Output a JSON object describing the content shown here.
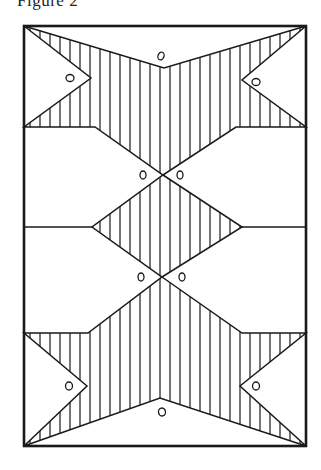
{
  "figure": {
    "title": "Figure 2",
    "colors": {
      "ink": "#1a1a1a",
      "paper": "#ffffff"
    },
    "frame": {
      "x1": 24,
      "y1": 26,
      "x2": 306,
      "y2": 446
    },
    "hatch_spacing": 10,
    "regions": [
      {
        "name": "top-hatched-band",
        "hatched": true,
        "points": [
          [
            24,
            26
          ],
          [
            164,
            68
          ],
          [
            306,
            26
          ],
          [
            242,
            80
          ],
          [
            306,
            127
          ],
          [
            236,
            127
          ],
          [
            163,
            175
          ],
          [
            95,
            127
          ],
          [
            24,
            127
          ],
          [
            91,
            78
          ]
        ]
      },
      {
        "name": "middle-diamond",
        "hatched": true,
        "points": [
          [
            163,
            175
          ],
          [
            242,
            227
          ],
          [
            162,
            277
          ],
          [
            92,
            227
          ]
        ]
      },
      {
        "name": "bottom-hatched-band",
        "hatched": true,
        "points": [
          [
            162,
            277
          ],
          [
            242,
            333
          ],
          [
            306,
            333
          ],
          [
            240,
            386
          ],
          [
            306,
            446
          ],
          [
            160,
            398
          ],
          [
            24,
            446
          ],
          [
            87,
            386
          ],
          [
            24,
            333
          ],
          [
            88,
            333
          ]
        ]
      }
    ],
    "lines": [
      {
        "name": "middle-left-rule",
        "x1": 24,
        "y1": 227,
        "x2": 92,
        "y2": 227
      },
      {
        "name": "middle-right-rule",
        "x1": 242,
        "y1": 227,
        "x2": 306,
        "y2": 227
      }
    ],
    "marks": [
      {
        "name": "mark-top-center",
        "cx": 161,
        "cy": 56,
        "rx": 3,
        "ry": 4,
        "rot": 20
      },
      {
        "name": "mark-top-left",
        "cx": 70,
        "cy": 78,
        "rx": 4,
        "ry": 3.5,
        "rot": 0
      },
      {
        "name": "mark-top-right",
        "cx": 256,
        "cy": 82,
        "rx": 4,
        "ry": 3.5,
        "rot": 0
      },
      {
        "name": "mark-cross1-left",
        "cx": 143,
        "cy": 175,
        "rx": 3,
        "ry": 4,
        "rot": 0
      },
      {
        "name": "mark-cross1-right",
        "cx": 180,
        "cy": 175,
        "rx": 3,
        "ry": 4,
        "rot": 0
      },
      {
        "name": "mark-cross2-left",
        "cx": 141,
        "cy": 277,
        "rx": 3,
        "ry": 4,
        "rot": 0
      },
      {
        "name": "mark-cross2-right",
        "cx": 182,
        "cy": 277,
        "rx": 3,
        "ry": 4,
        "rot": 0
      },
      {
        "name": "mark-bottom-left",
        "cx": 69,
        "cy": 386,
        "rx": 3.5,
        "ry": 4,
        "rot": 0
      },
      {
        "name": "mark-bottom-right",
        "cx": 256,
        "cy": 386,
        "rx": 3.5,
        "ry": 4,
        "rot": 0
      },
      {
        "name": "mark-bottom-center",
        "cx": 162,
        "cy": 412,
        "rx": 3.5,
        "ry": 4,
        "rot": -10
      }
    ]
  }
}
